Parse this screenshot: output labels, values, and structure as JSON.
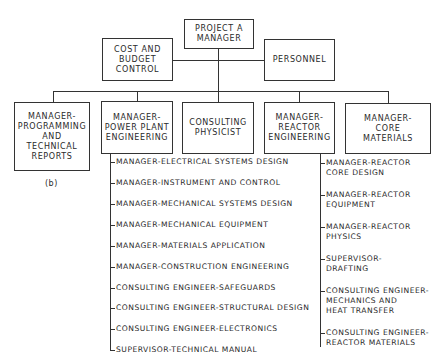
{
  "top": {
    "project_manager": "PROJECT A\nMANAGER",
    "cost_budget": "COST AND\nBUDGET\nCONTROL",
    "personnel": "PERSONNEL"
  },
  "departments": [
    {
      "label": "MANAGER-\nPROGRAMMING\nAND\nTECHNICAL\nREPORTS"
    },
    {
      "label": "MANAGER-\nPOWER PLANT\nENGINEERING"
    },
    {
      "label": "CONSULTING\nPHYSICIST"
    },
    {
      "label": "MANAGER-\nREACTOR\nENGINEERING"
    },
    {
      "label": "MANAGER-\nCORE\nMATERIALS"
    }
  ],
  "power_plant_items": [
    "MANAGER-ELECTRICAL SYSTEMS DESIGN",
    "MANAGER-INSTRUMENT AND CONTROL",
    "MANAGER-MECHANICAL SYSTEMS DESIGN",
    "MANAGER-MECHANICAL EQUIPMENT",
    "MANAGER-MATERIALS APPLICATION",
    "MANAGER-CONSTRUCTION ENGINEERING",
    "CONSULTING ENGINEER-SAFEGUARDS",
    "CONSULTING ENGINEER-STRUCTURAL DESIGN",
    "CONSULTING ENGINEER-ELECTRONICS",
    "SUPERVISOR-TECHNICAL MANUAL"
  ],
  "reactor_items": [
    "MANAGER-REACTOR\nCORE DESIGN",
    "MANAGER-REACTOR\nEQUIPMENT",
    "MANAGER-REACTOR\nPHYSICS",
    "SUPERVISOR-\nDRAFTING",
    "CONSULTING ENGINEER-\nMECHANICS AND\nHEAT TRANSFER",
    "CONSULTING ENGINEER-\nREACTOR MATERIALS"
  ],
  "caption": "(b)"
}
